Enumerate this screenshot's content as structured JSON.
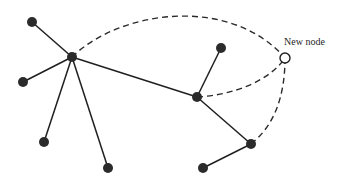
{
  "diagram": {
    "type": "network-graph",
    "new_node_label": "New node",
    "colors": {
      "node_fill": "#2b2b2b",
      "edge": "#1f1f1f",
      "new_node_fill": "#ffffff",
      "background": "#ffffff"
    },
    "nodes": [
      {
        "id": "leaf-top-left",
        "x": 32,
        "y": 22,
        "r": 5,
        "kind": "existing"
      },
      {
        "id": "hub-1",
        "x": 72,
        "y": 57,
        "r": 5,
        "kind": "existing"
      },
      {
        "id": "leaf-left",
        "x": 23,
        "y": 82,
        "r": 5,
        "kind": "existing"
      },
      {
        "id": "leaf-bottom-left",
        "x": 44,
        "y": 142,
        "r": 5,
        "kind": "existing"
      },
      {
        "id": "leaf-bottom-mid",
        "x": 108,
        "y": 168,
        "r": 5,
        "kind": "existing"
      },
      {
        "id": "hub-2",
        "x": 197,
        "y": 97,
        "r": 5,
        "kind": "existing"
      },
      {
        "id": "leaf-upper-right",
        "x": 221,
        "y": 48,
        "r": 5,
        "kind": "existing"
      },
      {
        "id": "hub-3",
        "x": 251,
        "y": 144,
        "r": 5,
        "kind": "existing"
      },
      {
        "id": "leaf-bottom-right",
        "x": 203,
        "y": 168,
        "r": 5,
        "kind": "existing"
      },
      {
        "id": "new-node",
        "x": 285,
        "y": 58,
        "r": 5,
        "kind": "new"
      }
    ],
    "edges": [
      {
        "from": "leaf-top-left",
        "to": "hub-1",
        "style": "solid"
      },
      {
        "from": "leaf-left",
        "to": "hub-1",
        "style": "solid"
      },
      {
        "from": "hub-1",
        "to": "leaf-bottom-left",
        "style": "solid"
      },
      {
        "from": "hub-1",
        "to": "leaf-bottom-mid",
        "style": "solid"
      },
      {
        "from": "hub-1",
        "to": "hub-2",
        "style": "solid"
      },
      {
        "from": "hub-2",
        "to": "leaf-upper-right",
        "style": "solid"
      },
      {
        "from": "hub-2",
        "to": "hub-3",
        "style": "solid"
      },
      {
        "from": "hub-3",
        "to": "leaf-bottom-right",
        "style": "solid"
      },
      {
        "from": "new-node",
        "to": "hub-1",
        "style": "dashed"
      },
      {
        "from": "new-node",
        "to": "hub-2",
        "style": "dashed"
      },
      {
        "from": "new-node",
        "to": "hub-3",
        "style": "dashed"
      }
    ]
  }
}
